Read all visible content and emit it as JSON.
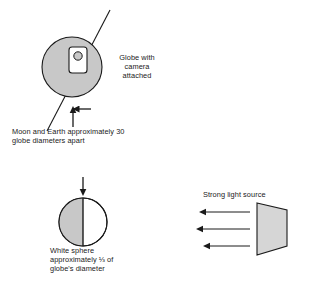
{
  "figure": {
    "background_color": "#ffffff",
    "stroke_color": "#1a1a1a",
    "fill_gray": "#c8c8c8",
    "fill_white": "#ffffff",
    "width": 310,
    "height": 284
  },
  "labels": {
    "globe_camera": "Globe with\ncamera\nattached",
    "moon_earth_distance": "Moon and Earth approximately 30\nglobe diameters apart",
    "white_sphere": "White sphere\napproximately ⅓ of\nglobe's diameter",
    "light_source": "Strong light source"
  },
  "shapes": {
    "globe": {
      "name": "globe",
      "cx": 72,
      "cy": 67,
      "r": 30,
      "fill": "#c8c8c8",
      "stroke": "#1a1a1a"
    },
    "globe_axis": {
      "name": "globe-axis-line",
      "x1": 110,
      "y1": 10,
      "x2": 47,
      "y2": 131,
      "stroke": "#1a1a1a"
    },
    "camera": {
      "name": "camera-body",
      "x": 69,
      "y": 47,
      "width": 18,
      "height": 26,
      "rx": 3,
      "fill": "#ffffff",
      "stroke": "#1a1a1a",
      "lens": {
        "name": "camera-lens",
        "cx": 78,
        "cy": 56,
        "r": 4.2,
        "fill": "#c8c8c8",
        "stroke": "#1a1a1a"
      }
    },
    "globe_pointer_arrow": {
      "name": "globe-pointer-arrow",
      "direction": "up",
      "x": 73,
      "y_tail": 127,
      "y_head": 108
    },
    "sphere": {
      "name": "white-sphere",
      "cx": 83,
      "cy": 222,
      "r": 24,
      "left_half_fill": "#c8c8c8",
      "right_half_fill": "#ffffff",
      "stroke": "#1a1a1a",
      "terminator_line": true
    },
    "sphere_pointer_arrow": {
      "name": "sphere-pointer-arrow",
      "direction": "down",
      "x": 83,
      "y_tail": 177,
      "y_head": 194
    },
    "light_source": {
      "name": "light-source-lamp",
      "points": "257,203 287,210 287,246 257,255",
      "fill": "#d6d6d6",
      "stroke": "#1a1a1a"
    },
    "light_rays": [
      {
        "name": "light-ray-1",
        "y": 212,
        "x_tail": 250,
        "x_head": 200
      },
      {
        "name": "light-ray-2",
        "y": 229,
        "x_tail": 250,
        "x_head": 196
      },
      {
        "name": "light-ray-3",
        "y": 246,
        "x_tail": 250,
        "x_head": 203
      }
    ]
  }
}
